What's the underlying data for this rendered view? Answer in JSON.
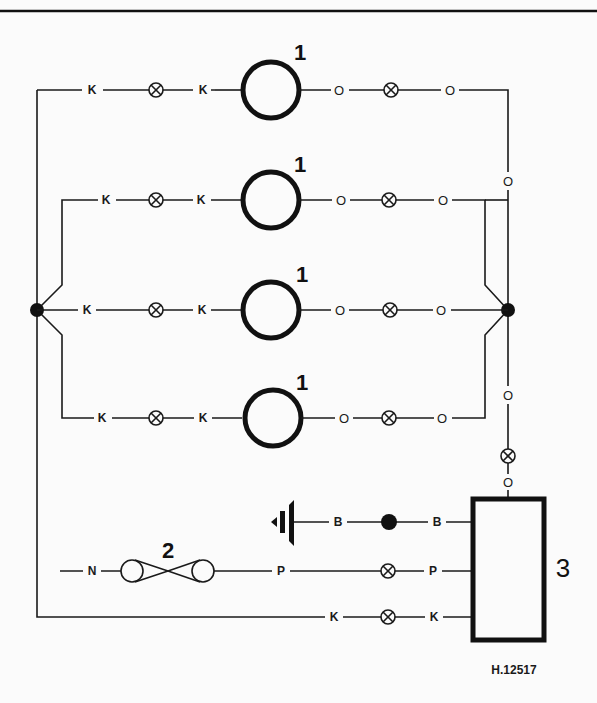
{
  "diagram": {
    "type": "wiring-diagram",
    "reference_number": "H.12517",
    "components": [
      {
        "id": "1",
        "label": "1",
        "description": "lamp",
        "count": 4
      },
      {
        "id": "2",
        "label": "2",
        "description": "switch"
      },
      {
        "id": "3",
        "label": "3",
        "description": "control unit"
      }
    ],
    "wire_codes": {
      "K": "K",
      "O": "O",
      "B": "B",
      "N": "N",
      "P": "P"
    },
    "lamp_rows": [
      {
        "component_label": "1",
        "left_code_a": "K",
        "left_code_b": "K",
        "right_code_a": "O",
        "right_code_b": "O"
      },
      {
        "component_label": "1",
        "left_code_a": "K",
        "left_code_b": "K",
        "right_code_a": "O",
        "right_code_b": "O"
      },
      {
        "component_label": "1",
        "left_code_a": "K",
        "left_code_b": "K",
        "right_code_a": "O",
        "right_code_b": "O"
      },
      {
        "component_label": "1",
        "left_code_a": "K",
        "left_code_b": "K",
        "right_code_a": "O",
        "right_code_b": "O"
      }
    ],
    "trunk_codes": {
      "right_upper": "O",
      "right_lower": "O",
      "right_box": "O"
    },
    "ground_row": {
      "code_a": "B",
      "code_b": "B"
    },
    "switch_row": {
      "code_in": "N",
      "code_out_a": "P",
      "code_out_b": "P"
    },
    "return_row": {
      "code_a": "K",
      "code_b": "K"
    }
  }
}
